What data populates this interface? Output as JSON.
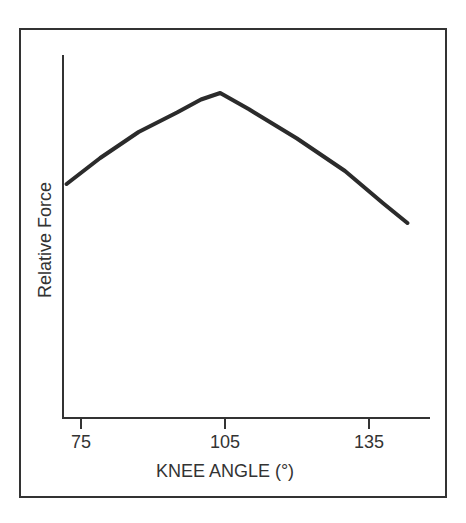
{
  "chart_data": {
    "type": "line",
    "title": "",
    "xlabel": "KNEE ANGLE (°)",
    "ylabel": "Relative Force",
    "x_ticks": [
      75,
      105,
      135
    ],
    "xlim": [
      72,
      146
    ],
    "ylim": [
      0,
      1.1
    ],
    "y_ticks": [],
    "grid": false,
    "legend": null,
    "series": [
      {
        "name": "Relative Force",
        "color": "#2b2b2b",
        "x": [
          72,
          79,
          87,
          95,
          100,
          104,
          110,
          120,
          130,
          138,
          143
        ],
        "y": [
          0.72,
          0.8,
          0.88,
          0.94,
          0.98,
          1.0,
          0.95,
          0.86,
          0.76,
          0.66,
          0.6
        ]
      }
    ]
  },
  "axes": {
    "x_label": "KNEE ANGLE (°)",
    "y_label": "Relative Force",
    "x_ticks": [
      {
        "label": "75",
        "value": 75
      },
      {
        "label": "105",
        "value": 105
      },
      {
        "label": "135",
        "value": 135
      }
    ]
  }
}
